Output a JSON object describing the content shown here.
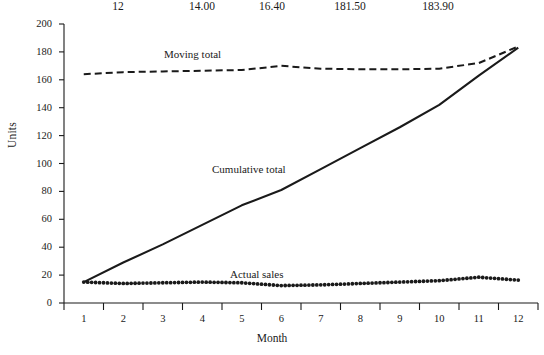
{
  "table_strip": {
    "cells": [
      {
        "text": "12",
        "x": 118
      },
      {
        "text": "14.00",
        "x": 202
      },
      {
        "text": "16.40",
        "x": 272
      },
      {
        "text": "181.50",
        "x": 350
      },
      {
        "text": "183.90",
        "x": 438
      }
    ]
  },
  "chart_data": {
    "type": "line",
    "title": "",
    "xlabel": "Month",
    "ylabel": "Units",
    "x": [
      1,
      2,
      3,
      4,
      5,
      6,
      7,
      8,
      9,
      10,
      11,
      12
    ],
    "xtick_labels": [
      "1",
      "2",
      "3",
      "4",
      "5",
      "6",
      "7",
      "8",
      "9",
      "10",
      "11",
      "12"
    ],
    "ytick_labels": [
      "0",
      "20",
      "40",
      "60",
      "80",
      "100",
      "120",
      "140",
      "160",
      "180",
      "200"
    ],
    "ylim": [
      0,
      200
    ],
    "xlim": [
      0.5,
      12.5
    ],
    "grid": false,
    "legend": "inline-annotations",
    "series": [
      {
        "name": "Moving total",
        "style": "dashed",
        "label_x": 1.9,
        "values": [
          164.0,
          165.5,
          166.0,
          166.5,
          167.0,
          170.0,
          168.0,
          167.5,
          167.5,
          168.0,
          172.0,
          183.9
        ]
      },
      {
        "name": "Cumulative total",
        "style": "solid",
        "label_x": 4.9,
        "values": [
          15.0,
          29.0,
          42.0,
          56.0,
          70.0,
          81.0,
          96.0,
          111.0,
          126.0,
          142.0,
          163.0,
          183.0
        ]
      },
      {
        "name": "Actual sales",
        "style": "dotted",
        "label_x": 5.6,
        "values": [
          15.0,
          14.0,
          14.5,
          15.0,
          14.5,
          12.5,
          13.0,
          14.0,
          15.0,
          16.0,
          18.5,
          16.4
        ]
      }
    ]
  }
}
